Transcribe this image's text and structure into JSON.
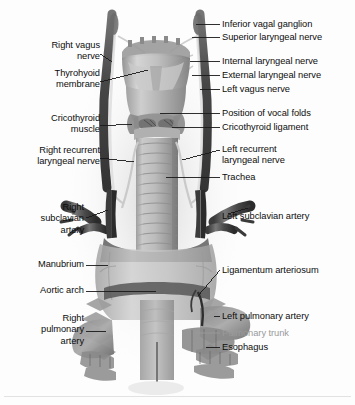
{
  "figure": {
    "background_color": "#fdfdfd",
    "label_color": "#0d0d0d",
    "faded_label_color": "#9a9a9a",
    "leader_line_color": "#1a1a1a"
  },
  "labels_left": [
    {
      "id": "right-vagus-nerve",
      "text": "Right vagus\nnerve",
      "x": 8,
      "y": 40,
      "w": 92
    },
    {
      "id": "thyrohyoid-membrane",
      "text": "Thyrohyoid\nmembrane",
      "x": 8,
      "y": 68,
      "w": 92
    },
    {
      "id": "cricothyroid-muscle",
      "text": "Cricothyroid\nmuscle",
      "x": 8,
      "y": 113,
      "w": 92
    },
    {
      "id": "right-recurrent-laryngeal-nerve",
      "text": "Right recurrent\nlaryngeal nerve",
      "x": 2,
      "y": 145,
      "w": 98
    },
    {
      "id": "right-subclavian-artery",
      "text": "Right\nsubclavian\nartery",
      "x": 8,
      "y": 202,
      "w": 76
    },
    {
      "id": "manubrium",
      "text": "Manubrium",
      "x": 8,
      "y": 259,
      "w": 76
    },
    {
      "id": "aortic-arch",
      "text": "Aortic arch",
      "x": 8,
      "y": 285,
      "w": 76
    },
    {
      "id": "right-pulmonary-artery",
      "text": "Right\npulmonary\nartery",
      "x": 8,
      "y": 313,
      "w": 76
    }
  ],
  "labels_right": [
    {
      "id": "inferior-vagal-ganglion",
      "text": "Inferior vagal ganglion",
      "x": 222,
      "y": 19,
      "faded": false
    },
    {
      "id": "superior-laryngeal-nerve",
      "text": "Superior laryngeal nerve",
      "x": 222,
      "y": 32,
      "faded": false
    },
    {
      "id": "internal-laryngeal-nerve",
      "text": "Internal laryngeal nerve",
      "x": 222,
      "y": 56,
      "faded": false
    },
    {
      "id": "external-laryngeal-nerve",
      "text": "External laryngeal nerve",
      "x": 222,
      "y": 70,
      "faded": false
    },
    {
      "id": "left-vagus-nerve",
      "text": "Left vagus nerve",
      "x": 222,
      "y": 84,
      "faded": false
    },
    {
      "id": "position-of-vocal-folds",
      "text": "Position of vocal folds",
      "x": 222,
      "y": 108,
      "faded": false
    },
    {
      "id": "cricothyroid-ligament",
      "text": "Cricothyroid ligament",
      "x": 222,
      "y": 122,
      "faded": false
    },
    {
      "id": "left-recurrent-laryngeal-nerve",
      "text": "Left recurrent\nlaryngeal nerve",
      "x": 222,
      "y": 144,
      "faded": false
    },
    {
      "id": "trachea",
      "text": "Trachea",
      "x": 222,
      "y": 172,
      "faded": false
    },
    {
      "id": "left-subclavian-artery",
      "text": "Left subclavian artery",
      "x": 222,
      "y": 211,
      "faded": false
    },
    {
      "id": "ligamentum-arteriosum",
      "text": "Ligamentum arteriosum",
      "x": 222,
      "y": 265,
      "faded": false
    },
    {
      "id": "left-pulmonary-artery",
      "text": "Left pulmonary artery",
      "x": 222,
      "y": 311,
      "faded": false
    },
    {
      "id": "pulmonary-trunk",
      "text": "Pulmonary trunk",
      "x": 222,
      "y": 328,
      "faded": true
    },
    {
      "id": "esophagus",
      "text": "Esophagus",
      "x": 222,
      "y": 342,
      "faded": false
    }
  ]
}
